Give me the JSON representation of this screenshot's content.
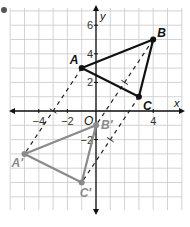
{
  "figure": {
    "bullet_color": "#555555",
    "grid": {
      "xmin": -6,
      "xmax": 6,
      "ymin": -7,
      "ymax": 7,
      "line_color": "#c8c8c8"
    },
    "axes": {
      "x_label": "x",
      "y_label": "y",
      "origin_label": "O",
      "color": "#111111"
    },
    "x_ticks": [
      {
        "value": -4,
        "label": "−4"
      },
      {
        "value": -2,
        "label": "−2"
      },
      {
        "value": 4,
        "label": "4"
      }
    ],
    "y_ticks": [
      {
        "value": 6,
        "label": "6"
      },
      {
        "value": 4,
        "label": "4"
      },
      {
        "value": 2,
        "label": "2"
      },
      {
        "value": -2,
        "label": "−2"
      }
    ],
    "original_triangle": {
      "color": "#111111",
      "vertices": [
        {
          "label": "A",
          "x": -1,
          "y": 3
        },
        {
          "label": "B",
          "x": 4,
          "y": 5
        },
        {
          "label": "C",
          "x": 3,
          "y": 1
        }
      ]
    },
    "image_triangle": {
      "color": "#8a8a8a",
      "vertices": [
        {
          "label": "A′",
          "x": -5,
          "y": -3
        },
        {
          "label": "B′",
          "x": 0,
          "y": -1
        },
        {
          "label": "C′",
          "x": -1,
          "y": -5
        }
      ]
    },
    "translation_lines": {
      "style": "dashed",
      "color": "#222222",
      "has_tick_marks": true
    }
  }
}
